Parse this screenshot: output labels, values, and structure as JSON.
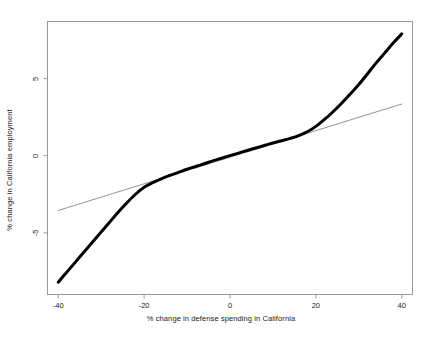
{
  "chart_data": {
    "type": "line",
    "title": "",
    "subtitle": "",
    "xlabel": "% change in defense spending in California",
    "ylabel": "% change in California employment",
    "xlim": [
      -42.5,
      42.5
    ],
    "ylim": [
      -9.0,
      8.7
    ],
    "xticks": [
      -40,
      -20,
      0,
      20,
      40
    ],
    "xtick_labels": [
      "-40",
      "-20",
      "0",
      "20",
      "40"
    ],
    "yticks": [
      -5,
      0,
      5
    ],
    "ytick_labels": [
      "-5",
      "0",
      "5"
    ],
    "grid": false,
    "legend": "none",
    "frame_color": "#9a9a9a",
    "background": "#ffffff",
    "series": [
      {
        "name": "nonparametric-fit",
        "style": "thick-black-curve",
        "color": "#000000",
        "width": 3.0,
        "x": [
          -40,
          -38,
          -36,
          -34,
          -32,
          -30,
          -28,
          -26,
          -24,
          -22,
          -20,
          -18,
          -16,
          -14,
          -12,
          -10,
          -8,
          -6,
          -4,
          -2,
          0,
          2,
          4,
          6,
          8,
          10,
          12,
          14,
          16,
          18,
          20,
          22,
          24,
          26,
          28,
          30,
          32,
          34,
          36,
          38,
          40
        ],
        "y": [
          -8.2,
          -7.55,
          -6.9,
          -6.25,
          -5.6,
          -4.95,
          -4.3,
          -3.65,
          -3.05,
          -2.5,
          -2.05,
          -1.75,
          -1.5,
          -1.28,
          -1.08,
          -0.88,
          -0.7,
          -0.52,
          -0.34,
          -0.17,
          0.0,
          0.17,
          0.34,
          0.5,
          0.66,
          0.82,
          0.97,
          1.12,
          1.3,
          1.55,
          1.9,
          2.35,
          2.85,
          3.4,
          4.0,
          4.62,
          5.3,
          6.0,
          6.65,
          7.3,
          7.9
        ]
      },
      {
        "name": "linear-fit",
        "style": "thin-gray-line",
        "color": "#777777",
        "width": 0.8,
        "x": [
          -40,
          40
        ],
        "y": [
          -3.55,
          3.35
        ],
        "slope": 0.0863,
        "intercept": -0.1
      }
    ],
    "annotations": [],
    "crossings": [
      {
        "x": -21.5,
        "y": -1.95
      },
      {
        "x": 20.5,
        "y": 2.05
      }
    ]
  },
  "axes": {
    "x_tick_label_0": "-40",
    "x_tick_label_1": "-20",
    "x_tick_label_2": "0",
    "x_tick_label_3": "20",
    "x_tick_label_4": "40",
    "y_tick_label_0": "-5",
    "y_tick_label_1": "0",
    "y_tick_label_2": "5"
  },
  "labels": {
    "x_axis_title": "% change in defense spending in California",
    "y_axis_title": "% change in California employment"
  }
}
